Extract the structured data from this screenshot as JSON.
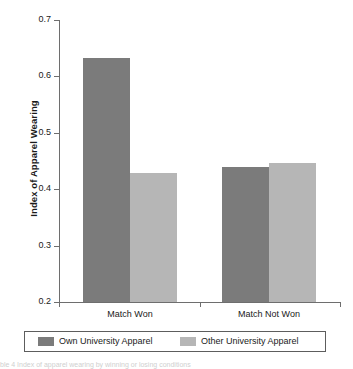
{
  "chart_data": {
    "type": "bar",
    "title": "",
    "xlabel": "",
    "ylabel": "Index of Apparel Wearing",
    "categories": [
      "Match Won",
      "Match Not Won"
    ],
    "series": [
      {
        "name": "Own University Apparel",
        "values": [
          0.633,
          0.439
        ]
      },
      {
        "name": "Other University Apparel",
        "values": [
          0.429,
          0.447
        ]
      }
    ],
    "ylim": [
      0.2,
      0.7
    ],
    "yticks": [
      0.2,
      0.3,
      0.4,
      0.5,
      0.6,
      0.7
    ],
    "ytick_labels": [
      "0.2",
      "0.3",
      "0.4",
      "0.5",
      "0.6",
      "0.7"
    ],
    "grid": false,
    "legend_position": "bottom",
    "colors": {
      "own": "#7b7b7b",
      "other": "#b6b6b6",
      "axis": "#6e6e6e",
      "text": "#1a1a1a",
      "background": "#ffffff"
    }
  },
  "legend": {
    "entries": [
      {
        "label": "Own University Apparel",
        "swatch": "own"
      },
      {
        "label": "Other University Apparel",
        "swatch": "other"
      }
    ]
  },
  "caption_fragment": "ble 4 Index of apparel wearing by winning or losing conditions"
}
